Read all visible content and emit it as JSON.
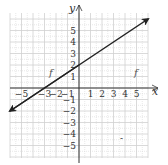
{
  "chart_data": {
    "type": "line",
    "title": "",
    "xlabel": "x",
    "ylabel": "y",
    "xlim": [
      -6,
      6
    ],
    "ylim": [
      -6,
      6
    ],
    "grid": true,
    "x_ticks": [
      "-5",
      "-3",
      "-2",
      "-1",
      "1",
      "2",
      "3",
      "4",
      "5"
    ],
    "y_ticks": [
      "5",
      "4",
      "3",
      "2",
      "1",
      "-1",
      "-2",
      "-3",
      "-4",
      "-5"
    ],
    "series": [
      {
        "name": "f",
        "equation": "y = (2/3)x + 2",
        "x": [
          -6,
          -3,
          0,
          6
        ],
        "y": [
          -2,
          0,
          2,
          6
        ],
        "arrows": "both"
      }
    ],
    "annotations": [
      "f",
      "f"
    ]
  },
  "labels": {
    "x_axis": "x",
    "y_axis": "y",
    "line_label_left": "f",
    "line_label_right": "f"
  },
  "colors": {
    "line": "#222222",
    "grid": "#d0d0d0",
    "axis": "#333333"
  }
}
